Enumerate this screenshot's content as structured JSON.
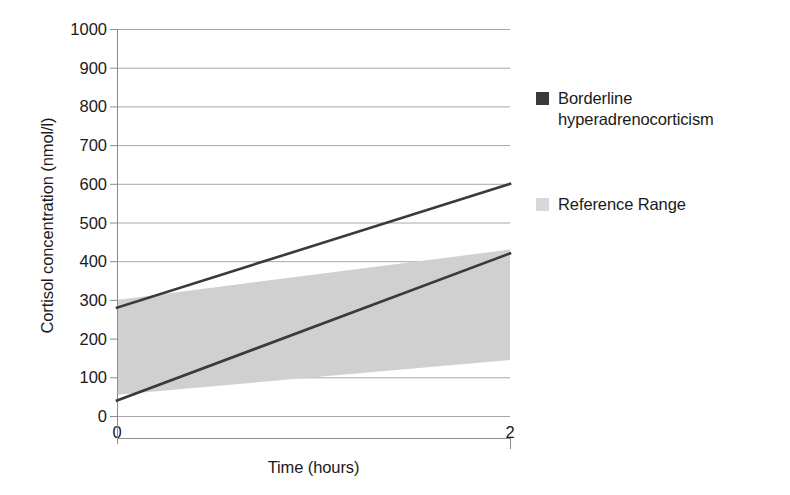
{
  "chart_data": {
    "type": "area",
    "title": "",
    "xlabel": "Time (hours)",
    "ylabel": "Cortisol concentration (nmol/l)",
    "xlim": [
      0,
      2
    ],
    "ylim": [
      0,
      1000
    ],
    "x_ticks": [
      "0",
      "2"
    ],
    "x_tick_values": [
      0,
      2
    ],
    "y_ticks": [
      "0",
      "100",
      "200",
      "300",
      "400",
      "500",
      "600",
      "700",
      "800",
      "900",
      "1000"
    ],
    "y_tick_values": [
      0,
      100,
      200,
      300,
      400,
      500,
      600,
      700,
      800,
      900,
      1000
    ],
    "grid": true,
    "grid_axis": "y",
    "legend_position": "right",
    "series": [
      {
        "name": "Borderline hyperadrenocorticism",
        "type": "line",
        "color": "#3a3a3a",
        "lines": [
          {
            "name": "upper-trace",
            "x": [
              0,
              2
            ],
            "values": [
              280,
              600
            ]
          },
          {
            "name": "lower-trace",
            "x": [
              0,
              2
            ],
            "values": [
              40,
              420
            ]
          }
        ]
      },
      {
        "name": "Reference Range",
        "type": "band",
        "color": "#d0d0d0",
        "x": [
          0,
          2
        ],
        "upper": [
          300,
          430
        ],
        "lower": [
          55,
          145
        ]
      }
    ],
    "legend": [
      {
        "label": "Borderline hyperadrenocorticism",
        "color": "#3a3a3a",
        "marker": "square"
      },
      {
        "label": "Reference Range",
        "color": "#d8d8d8",
        "marker": "square"
      }
    ],
    "colors": {
      "line": "#3a3a3a",
      "band": "#d0d0d0",
      "grid": "#a8a8a8",
      "axis": "#8c8c8c",
      "text": "#1a1a1a",
      "background": "#ffffff"
    }
  }
}
